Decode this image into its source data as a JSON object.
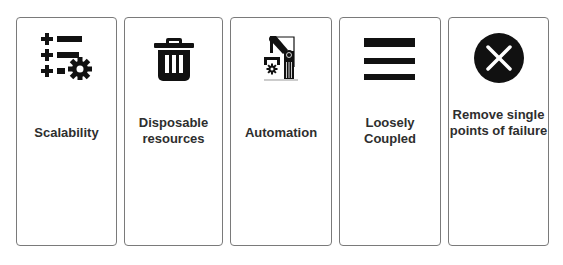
{
  "cards": [
    {
      "label": "Scalability",
      "icon": "scalability-list-gear-icon"
    },
    {
      "label": "Disposable resources",
      "icon": "trash-can-icon"
    },
    {
      "label": "Automation",
      "icon": "robotic-arm-icon"
    },
    {
      "label": "Loosely Coupled",
      "icon": "three-bars-icon"
    },
    {
      "label": "Remove single points of failure",
      "icon": "close-circle-icon"
    }
  ],
  "colors": {
    "border": "#7a7a7a",
    "icon": "#111111",
    "text": "#2e2e2e",
    "background": "#ffffff"
  }
}
